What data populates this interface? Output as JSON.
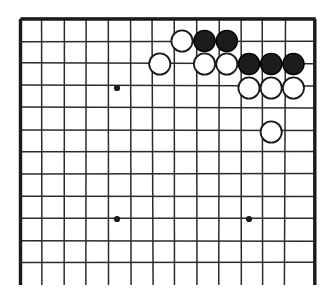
{
  "figure": {
    "kind": "go-board-diagram",
    "width": 336,
    "height": 295,
    "background_color": "#ffffff"
  },
  "board": {
    "line_color": "#2b2b2b",
    "edge_color": "#1a1a1a",
    "black_stone_color": "#1c1c1c",
    "white_stone_color": "#ffffff",
    "stone_outline_color": "#1a1a1a",
    "stone_radius": 10.6,
    "column_spacing": 22.05,
    "row_spacing": 22.15,
    "visible_columns": 14,
    "visible_rows": 12,
    "column_x": [
      20.5,
      42.2,
      64.3,
      86.3,
      108.4,
      130.4,
      152.5,
      174.5,
      196.6,
      218.6,
      240.7,
      262.7,
      284.8,
      314.8
    ],
    "row_y": [
      19.0,
      41.2,
      63.4,
      85.5,
      107.7,
      129.9,
      152.0,
      174.2,
      196.4,
      218.5,
      240.7,
      262.9
    ],
    "vertical_line_top": 19.0,
    "vertical_line_bottom": 285.0,
    "horizontal_line_left": 20.5,
    "horizontal_line_right": 314.8,
    "top_edge_y": 19.0,
    "left_edge_x": 20.5,
    "right_edge_x": 314.8
  },
  "star_points": [
    {
      "name": "star-point-upper-left",
      "x": 117.0,
      "y": 88.0
    },
    {
      "name": "star-point-lower-left",
      "x": 117.0,
      "y": 219.0
    },
    {
      "name": "star-point-lower-right",
      "x": 249.0,
      "y": 219.0
    }
  ],
  "stones": [
    {
      "name": "white-stone-1",
      "color": "white",
      "x": 182.0,
      "y": 41.0
    },
    {
      "name": "black-stone-1",
      "color": "black",
      "x": 204.5,
      "y": 41.0
    },
    {
      "name": "black-stone-2",
      "color": "black",
      "x": 226.8,
      "y": 41.0
    },
    {
      "name": "white-stone-2",
      "color": "white",
      "x": 159.8,
      "y": 64.0
    },
    {
      "name": "white-stone-3",
      "color": "white",
      "x": 204.5,
      "y": 64.0
    },
    {
      "name": "white-stone-4",
      "color": "white",
      "x": 226.8,
      "y": 64.0
    },
    {
      "name": "black-stone-3",
      "color": "black",
      "x": 249.0,
      "y": 64.0
    },
    {
      "name": "black-stone-4",
      "color": "black",
      "x": 271.2,
      "y": 64.0
    },
    {
      "name": "black-stone-5",
      "color": "black",
      "x": 293.4,
      "y": 64.0
    },
    {
      "name": "white-stone-5",
      "color": "white",
      "x": 249.0,
      "y": 88.0
    },
    {
      "name": "white-stone-6",
      "color": "white",
      "x": 271.2,
      "y": 88.0
    },
    {
      "name": "white-stone-7",
      "color": "white",
      "x": 293.4,
      "y": 88.0
    },
    {
      "name": "white-stone-8",
      "color": "white",
      "x": 271.2,
      "y": 132.0
    }
  ],
  "counts": {
    "black_stones": 5,
    "white_stones": 8,
    "total_stones": 13
  }
}
